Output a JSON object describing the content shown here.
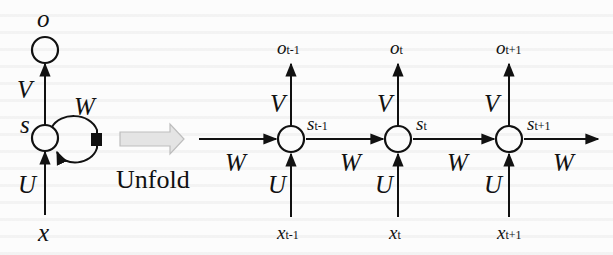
{
  "diagram": {
    "title": "",
    "folded": {
      "output_label": "o",
      "state_label": "s",
      "input_label": "x",
      "weight_in": "U",
      "weight_out": "V",
      "weight_recurrent": "W"
    },
    "transition": {
      "label": "Unfold",
      "arrow_color": "#d8d8d8"
    },
    "unfolded": [
      {
        "output": "o",
        "output_sub": "t-1",
        "state": "s",
        "state_sub": "t-1",
        "input": "x",
        "input_sub": "t-1",
        "V": "V",
        "U": "U",
        "W_in": "W"
      },
      {
        "output": "o",
        "output_sub": "t",
        "state": "s",
        "state_sub": "t",
        "input": "x",
        "input_sub": "t",
        "V": "V",
        "U": "U",
        "W_in": "W"
      },
      {
        "output": "o",
        "output_sub": "t+1",
        "state": "s",
        "state_sub": "t+1",
        "input": "x",
        "input_sub": "t+1",
        "V": "V",
        "U": "U",
        "W_in": "W"
      }
    ],
    "trailing_weight": "W",
    "colors": {
      "ink": "#111111",
      "background": "#fcfcfc"
    }
  }
}
